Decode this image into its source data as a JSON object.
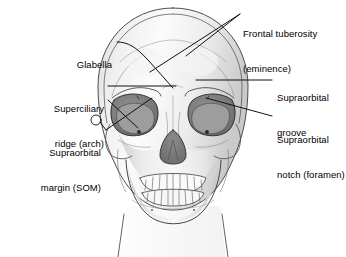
{
  "figure": {
    "background_color": "#ffffff",
    "line_color": "#1a1a1a",
    "text_color": "#000000"
  },
  "labels": [
    {
      "id": "glabella",
      "line1": "Glabella",
      "line2": "",
      "align": "right",
      "x": 112,
      "y": 36
    },
    {
      "id": "superciliary-ridge",
      "line1": "Superciliary",
      "line2": "ridge (arch)",
      "align": "right",
      "x": 104,
      "y": 80
    },
    {
      "id": "supraorbital-margin",
      "line1": "Supraorbital",
      "line2": "margin (SOM)",
      "align": "right",
      "x": 101,
      "y": 124
    },
    {
      "id": "frontal-tuberosity",
      "line1": "Frontal tuberosity",
      "line2": "(eminence)",
      "align": "left",
      "x": 243,
      "y": 5
    },
    {
      "id": "supraorbital-groove",
      "line1": "Supraorbital",
      "line2": "groove",
      "align": "left",
      "x": 277,
      "y": 69
    },
    {
      "id": "supraorbital-notch",
      "line1": "Supraorbital",
      "line2": "notch (foramen)",
      "align": "left",
      "x": 277,
      "y": 111
    }
  ],
  "anatomy_parts": [
    "cranium-outline",
    "scalp-contour",
    "frontal-bone",
    "temporal-line",
    "left-orbit",
    "right-orbit",
    "nasal-aperture",
    "zygomatic-arch-left",
    "zygomatic-arch-right",
    "maxilla",
    "upper-teeth",
    "lower-teeth",
    "mandible",
    "neck-outline"
  ]
}
